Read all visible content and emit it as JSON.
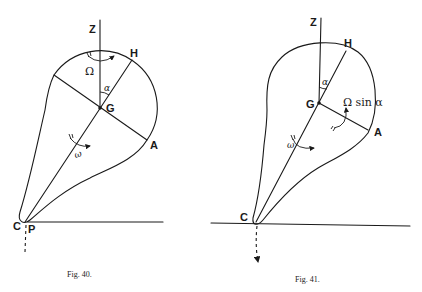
{
  "figures": [
    {
      "id": "fig40",
      "caption": "Fig. 40.",
      "labels": {
        "z": "Z",
        "h": "H",
        "g": "G",
        "a": "A",
        "c": "C",
        "p": "P",
        "omega_big": "Ω",
        "alpha": "α",
        "omega_small": "ω"
      }
    },
    {
      "id": "fig41",
      "caption": "Fig. 41.",
      "labels": {
        "z": "Z",
        "h": "H",
        "g": "G",
        "a": "A",
        "c": "C",
        "omega_big_sin": "Ω sin α",
        "alpha": "α",
        "omega_small": "ω"
      }
    }
  ],
  "colors": {
    "ink": "#1a1a1a",
    "background": "#ffffff"
  }
}
